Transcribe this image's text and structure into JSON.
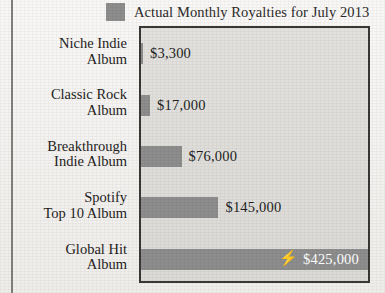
{
  "legend": {
    "swatch_color": "#8d8d8d",
    "label": "Actual Monthly Royalties for July 2013"
  },
  "categories": [
    {
      "line1": "Niche Indie",
      "line2": "Album"
    },
    {
      "line1": "Classic Rock",
      "line2": "Album"
    },
    {
      "line1": "Breakthrough",
      "line2": "Indie Album"
    },
    {
      "line1": "Spotify",
      "line2": "Top 10 Album"
    },
    {
      "line1": "Global Hit",
      "line2": "Album"
    }
  ],
  "bars": [
    {
      "value_label": "$3,300",
      "icon": "",
      "inside": false
    },
    {
      "value_label": "$17,000",
      "icon": "",
      "inside": false
    },
    {
      "value_label": "$76,000",
      "icon": "",
      "inside": false
    },
    {
      "value_label": "$145,000",
      "icon": "",
      "inside": false
    },
    {
      "value_label": "$425,000",
      "icon": "lightning-bolt-icon",
      "inside": true
    }
  ],
  "bolt_glyph": "⚡",
  "chart_data": {
    "type": "bar",
    "orientation": "horizontal",
    "title": "",
    "subtitle": "",
    "xlabel": "",
    "ylabel": "",
    "categories": [
      "Niche Indie Album",
      "Classic Rock Album",
      "Breakthrough Indie Album",
      "Spotify Top 10 Album",
      "Global Hit Album"
    ],
    "values": [
      3300,
      17000,
      76000,
      145000,
      425000
    ],
    "value_labels": [
      "$3,300",
      "$17,000",
      "$76,000",
      "$145,000",
      "$425,000"
    ],
    "series": [
      {
        "name": "Actual Monthly Royalties for July 2013",
        "values": [
          3300,
          17000,
          76000,
          145000,
          425000
        ],
        "color": "#8d8d8d"
      }
    ],
    "xlim": [
      0,
      425000
    ],
    "grid": false,
    "legend": "top",
    "legend_entries": [
      "Actual Monthly Royalties for July 2013"
    ],
    "annotations": [
      {
        "category": "Global Hit Album",
        "text": "$425,000",
        "icon": "lightning-bolt-icon",
        "placement": "inside-bar"
      }
    ],
    "tick_labels": {
      "x": [],
      "y": [
        "Niche Indie Album",
        "Classic Rock Album",
        "Breakthrough Indie Album",
        "Spotify Top 10 Album",
        "Global Hit Album"
      ]
    }
  }
}
